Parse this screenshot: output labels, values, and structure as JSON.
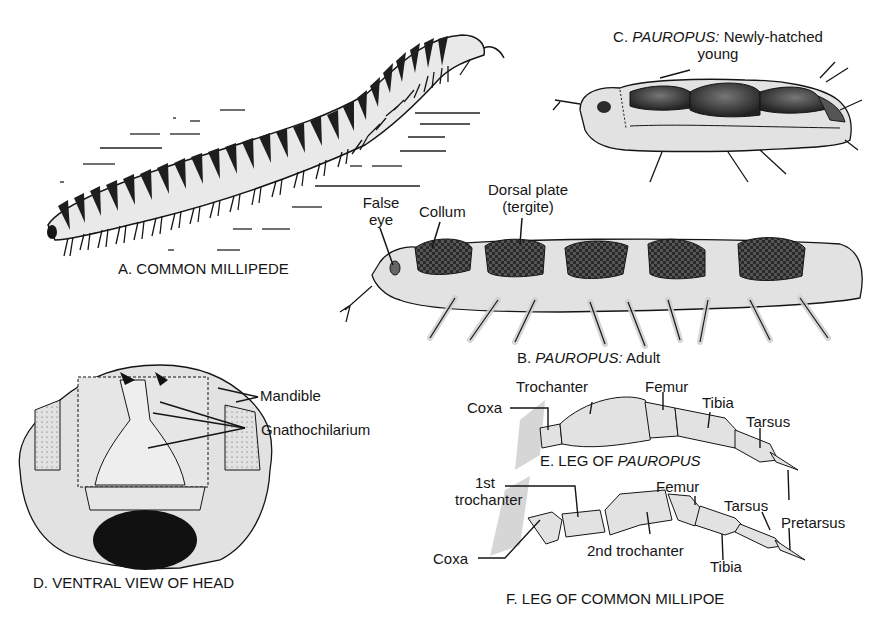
{
  "figure": {
    "panels": {
      "A": {
        "caption": "A. COMMON MILLIPEDE"
      },
      "B": {
        "caption_prefix": "B.",
        "caption_italic": "PAUROPUS:",
        "caption_suffix": "Adult",
        "labels": {
          "false_eye_1": "False",
          "false_eye_2": "eye",
          "collum": "Collum",
          "dorsal_plate_1": "Dorsal plate",
          "dorsal_plate_2": "(tergite)"
        }
      },
      "C": {
        "caption_prefix": "C.",
        "caption_italic": "PAUROPUS:",
        "caption_suffix": "Newly-hatched",
        "caption_line2": "young"
      },
      "D": {
        "caption": "D. VENTRAL VIEW OF HEAD",
        "labels": {
          "mandible": "Mandible",
          "gnathochilarium": "Gnathochilarium"
        }
      },
      "E": {
        "caption_prefix": "E. LEG OF",
        "caption_italic": "PAUROPUS",
        "labels": {
          "coxa": "Coxa",
          "trochanter": "Trochanter",
          "femur": "Femur",
          "tibia": "Tibia",
          "tarsus": "Tarsus"
        }
      },
      "F": {
        "caption": "F. LEG OF COMMON MILLIPOE",
        "labels": {
          "first_trochanter_1": "1st",
          "first_trochanter_2": "trochanter",
          "coxa": "Coxa",
          "second_trochanter": "2nd trochanter",
          "femur": "Femur",
          "tibia": "Tibia",
          "tarsus": "Tarsus",
          "pretarsus": "Pretarsus"
        }
      }
    },
    "colors": {
      "ink": "#151515",
      "fill": "#e2e2e2",
      "dark": "#2a2a2a"
    }
  }
}
